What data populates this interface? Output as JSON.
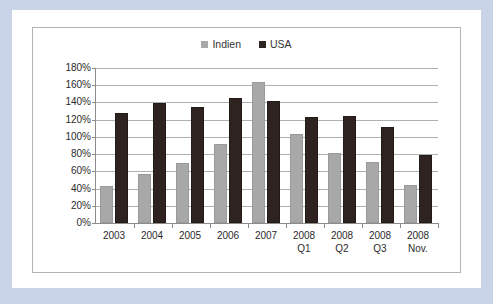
{
  "chart_data": {
    "type": "bar",
    "title": "",
    "subtitle": "",
    "xlabel": "",
    "ylabel": "",
    "categories": [
      "2003",
      "2004",
      "2005",
      "2006",
      "2007",
      "2008 Q1",
      "2008 Q2",
      "2008 Q3",
      "2008\nNov."
    ],
    "series": [
      {
        "name": "Indien",
        "color": "#a8a8a8",
        "values": [
          43,
          57,
          70,
          92,
          164,
          103,
          81,
          71,
          44
        ]
      },
      {
        "name": "USA",
        "color": "#2e2320",
        "values": [
          128,
          139,
          135,
          145,
          142,
          123,
          124,
          112,
          79
        ]
      }
    ],
    "ylim": [
      0,
      180
    ],
    "ytick_values": [
      0,
      20,
      40,
      60,
      80,
      100,
      120,
      140,
      160,
      180
    ],
    "ytick_labels": [
      "0%",
      "20%",
      "40%",
      "60%",
      "80%",
      "100%",
      "120%",
      "140%",
      "160%",
      "180%"
    ],
    "grid": true,
    "grid_axis": "y",
    "legend_position": "top-center",
    "value_unit": "%"
  },
  "legend": {
    "entries": [
      {
        "label": "Indien",
        "swatch": "legend-swatch-indien",
        "color": "#a8a8a8"
      },
      {
        "label": "USA",
        "swatch": "legend-swatch-usa",
        "color": "#2e2320"
      }
    ]
  },
  "colors": {
    "page_border": "#c9d4e8",
    "page_background": "#ffffff",
    "chart_frame_border": "#b3b3b3",
    "gridline": "#b0b0b0",
    "axis": "#8c8c8c",
    "text": "#2b2b2b"
  }
}
